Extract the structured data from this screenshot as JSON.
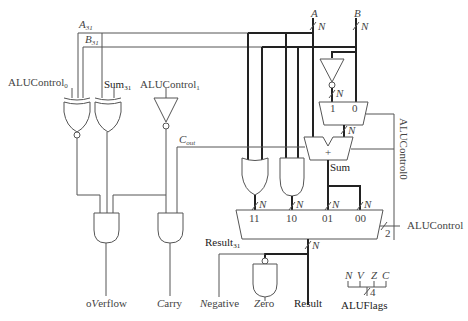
{
  "diagram": {
    "type": "ALU circuit schematic",
    "inputs": {
      "a": "A",
      "b": "B",
      "bus_width": "N",
      "a31": "A",
      "a31_sub": "31",
      "b31": "B",
      "b31_sub": "31"
    },
    "controls": {
      "alucontrol0": "ALUControl",
      "alucontrol0_sub": "0",
      "alucontrol1": "ALUControl",
      "alucontrol1_sub": "1",
      "alucontrol0_vertical": "ALUControl0",
      "alucontrol": "ALUControl",
      "alucontrol_width": "2"
    },
    "signals": {
      "sum31": "Sum",
      "sum31_sub": "31",
      "cout": "C",
      "cout_sub": "out",
      "sum": "Sum",
      "result31": "Result",
      "result31_sub": "31",
      "plus": "+"
    },
    "mux_b": {
      "in1": "1",
      "in0": "0"
    },
    "mux_result": {
      "inputs": [
        "11",
        "10",
        "01",
        "00"
      ]
    },
    "outputs": {
      "overflow_pre": "o",
      "overflow_key": "V",
      "overflow_post": "erflow",
      "carry_key": "C",
      "carry_post": "arry",
      "negative_key": "N",
      "negative_post": "egative",
      "zero_key": "Z",
      "zero_post": "ero",
      "result": "Result"
    },
    "flags": {
      "labels": [
        "N",
        "V",
        "Z",
        "C"
      ],
      "width": "4",
      "name": "ALUFlags"
    }
  }
}
